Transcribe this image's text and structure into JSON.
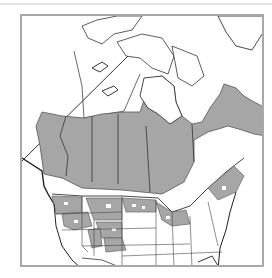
{
  "map": {
    "title": "",
    "region": "North America (Canada, United States, northern Mexico)",
    "legend": [],
    "colors": {
      "range_fill": "#a6a6a6",
      "land": "#ffffff",
      "border": "#333333",
      "frame": "#a8a8a8"
    },
    "shaded_regions": [
      "Boreal Canada (BC, Alberta, Saskatchewan, Manitoba, Ontario, Quebec, Labrador)",
      "Pacific Northwest coast",
      "Northern Rocky Mountain states",
      "Upper Great Lakes",
      "Northeastern United States (patchy)"
    ]
  }
}
